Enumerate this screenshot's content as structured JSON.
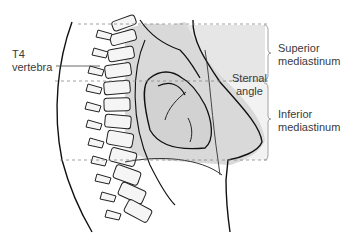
{
  "diagram": {
    "labels": {
      "t4_line1": "T4",
      "t4_line2": "vertebra",
      "sternal_line1": "Sternal",
      "sternal_line2": "angle",
      "superior_line1": "Superior",
      "superior_line2": "mediastinum",
      "inferior_line1": "Inferior",
      "inferior_line2": "mediastinum"
    },
    "colors": {
      "shade": "#d9d9d9",
      "light_shade": "#ececec",
      "line": "#111111",
      "dash": "#888888",
      "text": "#3a3a3a"
    }
  }
}
